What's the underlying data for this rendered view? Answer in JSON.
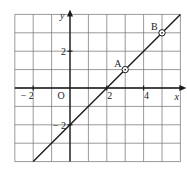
{
  "chart_data": {
    "type": "line",
    "title": "",
    "xlabel": "x",
    "ylabel": "y",
    "origin_label": "O",
    "xlim": [
      -3,
      6
    ],
    "ylim": [
      -4,
      4
    ],
    "grid": true,
    "grid_step": 1,
    "x_tick_labels": [
      {
        "value": -2,
        "label": "− 2"
      },
      {
        "value": 2,
        "label": "2"
      },
      {
        "value": 4,
        "label": "4"
      }
    ],
    "y_tick_labels": [
      {
        "value": 2,
        "label": "2"
      },
      {
        "value": -2,
        "label": "− 2"
      }
    ],
    "series": [
      {
        "name": "y = x − 2",
        "x": [
          -2,
          6
        ],
        "y": [
          -4,
          4
        ]
      }
    ],
    "points": [
      {
        "label": "A",
        "x": 3,
        "y": 1
      },
      {
        "label": "B",
        "x": 5,
        "y": 3
      }
    ]
  },
  "colors": {
    "grid": "#6e6e6e",
    "axis": "#1a1a1a",
    "line": "#1a1a1a",
    "background": "#ffffff"
  }
}
